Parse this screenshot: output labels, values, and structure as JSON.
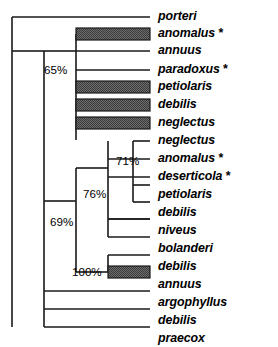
{
  "figure": {
    "kind": "phylogenetic-cladogram",
    "orientation": "left-to-right",
    "branch_color": "#000000",
    "highlight_fill": "#808080",
    "highlight_pattern": "checkerboard-stipple",
    "background": "#ffffff"
  },
  "taxa": [
    {
      "name": "porteri",
      "marked": false,
      "highlighted": false,
      "row": 0
    },
    {
      "name": "anomalus",
      "marked": true,
      "highlighted": true,
      "row": 1
    },
    {
      "name": "annuus",
      "marked": false,
      "highlighted": false,
      "row": 2
    },
    {
      "name": "paradoxus",
      "marked": true,
      "highlighted": false,
      "row": 3
    },
    {
      "name": "petiolaris",
      "marked": false,
      "highlighted": true,
      "row": 4
    },
    {
      "name": "debilis",
      "marked": false,
      "highlighted": true,
      "row": 5
    },
    {
      "name": "neglectus",
      "marked": false,
      "highlighted": true,
      "row": 6
    },
    {
      "name": "neglectus",
      "marked": false,
      "highlighted": false,
      "row": 7
    },
    {
      "name": "anomalus",
      "marked": true,
      "highlighted": false,
      "row": 8
    },
    {
      "name": "deserticola",
      "marked": true,
      "highlighted": false,
      "row": 9
    },
    {
      "name": "petiolaris",
      "marked": false,
      "highlighted": false,
      "row": 10
    },
    {
      "name": "debilis",
      "marked": false,
      "highlighted": false,
      "row": 11
    },
    {
      "name": "niveus",
      "marked": false,
      "highlighted": false,
      "row": 12
    },
    {
      "name": "bolanderi",
      "marked": false,
      "highlighted": false,
      "row": 13
    },
    {
      "name": "debilis",
      "marked": false,
      "highlighted": false,
      "row": 14
    },
    {
      "name": "annuus",
      "marked": false,
      "highlighted": true,
      "row": 15
    },
    {
      "name": "argophyllus",
      "marked": false,
      "highlighted": false,
      "row": 16
    },
    {
      "name": "debilis",
      "marked": false,
      "highlighted": false,
      "row": 17
    },
    {
      "name": "praecox",
      "marked": false,
      "highlighted": false,
      "row": 18
    }
  ],
  "marker_symbol": "*",
  "support_values": [
    {
      "id": "node-65",
      "label": "65%"
    },
    {
      "id": "node-71",
      "label": "71%"
    },
    {
      "id": "node-76",
      "label": "76%"
    },
    {
      "id": "node-69",
      "label": "69%"
    },
    {
      "id": "node-100",
      "label": "100%"
    }
  ]
}
